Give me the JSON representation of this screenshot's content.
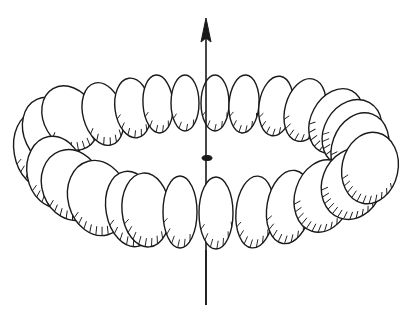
{
  "figure": {
    "description": "Line drawing of a ring of flattened ellipsoidal beads arranged around a vertical axis with an upward arrow; a small ellipse marks the ring center on the axis",
    "colors": {
      "ink": "#1a1a1a",
      "paper": "#ffffff"
    },
    "axis": {
      "x": 206,
      "y_top": 18,
      "y_bottom": 305,
      "arrow": "up"
    },
    "center_marker": {
      "cx": 207,
      "cy": 158,
      "rx": 5,
      "ry": 2.5
    },
    "ring": {
      "back_beads": [
        {
          "cx": 40,
          "cy": 150,
          "rx": 26,
          "ry": 38,
          "rot": -10
        },
        {
          "cx": 52,
          "cy": 132,
          "rx": 28,
          "ry": 36,
          "rot": -25
        },
        {
          "cx": 70,
          "cy": 118,
          "rx": 26,
          "ry": 34,
          "rot": -30
        },
        {
          "cx": 103,
          "cy": 114,
          "rx": 20,
          "ry": 32,
          "rot": -15
        },
        {
          "cx": 133,
          "cy": 108,
          "rx": 18,
          "ry": 30,
          "rot": -8
        },
        {
          "cx": 158,
          "cy": 104,
          "rx": 15,
          "ry": 29,
          "rot": -4
        },
        {
          "cx": 185,
          "cy": 103,
          "rx": 14,
          "ry": 28,
          "rot": 0
        },
        {
          "cx": 215,
          "cy": 103,
          "rx": 14,
          "ry": 28,
          "rot": 0
        },
        {
          "cx": 244,
          "cy": 104,
          "rx": 15,
          "ry": 29,
          "rot": 4
        },
        {
          "cx": 276,
          "cy": 106,
          "rx": 17,
          "ry": 30,
          "rot": 8
        },
        {
          "cx": 305,
          "cy": 110,
          "rx": 20,
          "ry": 32,
          "rot": 15
        },
        {
          "cx": 336,
          "cy": 121,
          "rx": 25,
          "ry": 34,
          "rot": 28
        },
        {
          "cx": 352,
          "cy": 133,
          "rx": 28,
          "ry": 35,
          "rot": 30
        },
        {
          "cx": 360,
          "cy": 148,
          "rx": 28,
          "ry": 36,
          "rot": 20
        }
      ],
      "front_beads": [
        {
          "cx": 55,
          "cy": 172,
          "rx": 28,
          "ry": 36,
          "rot": -10
        },
        {
          "cx": 72,
          "cy": 185,
          "rx": 30,
          "ry": 36,
          "rot": -20
        },
        {
          "cx": 98,
          "cy": 198,
          "rx": 30,
          "ry": 38,
          "rot": -15
        },
        {
          "cx": 131,
          "cy": 209,
          "rx": 25,
          "ry": 38,
          "rot": -10
        },
        {
          "cx": 145,
          "cy": 208,
          "rx": 1,
          "ry": 1,
          "rot": 0
        },
        {
          "cx": 146,
          "cy": 210,
          "rx": 24,
          "ry": 37,
          "rot": -5
        },
        {
          "cx": 180,
          "cy": 212,
          "rx": 17,
          "ry": 36,
          "rot": 0
        },
        {
          "cx": 216,
          "cy": 213,
          "rx": 17,
          "ry": 36,
          "rot": 0
        },
        {
          "cx": 255,
          "cy": 212,
          "rx": 19,
          "ry": 36,
          "rot": 5
        },
        {
          "cx": 289,
          "cy": 207,
          "rx": 22,
          "ry": 37,
          "rot": 10
        },
        {
          "cx": 323,
          "cy": 196,
          "rx": 28,
          "ry": 37,
          "rot": 18
        },
        {
          "cx": 352,
          "cy": 184,
          "rx": 30,
          "ry": 36,
          "rot": 20
        },
        {
          "cx": 370,
          "cy": 168,
          "rx": 28,
          "ry": 36,
          "rot": 12
        }
      ]
    }
  }
}
